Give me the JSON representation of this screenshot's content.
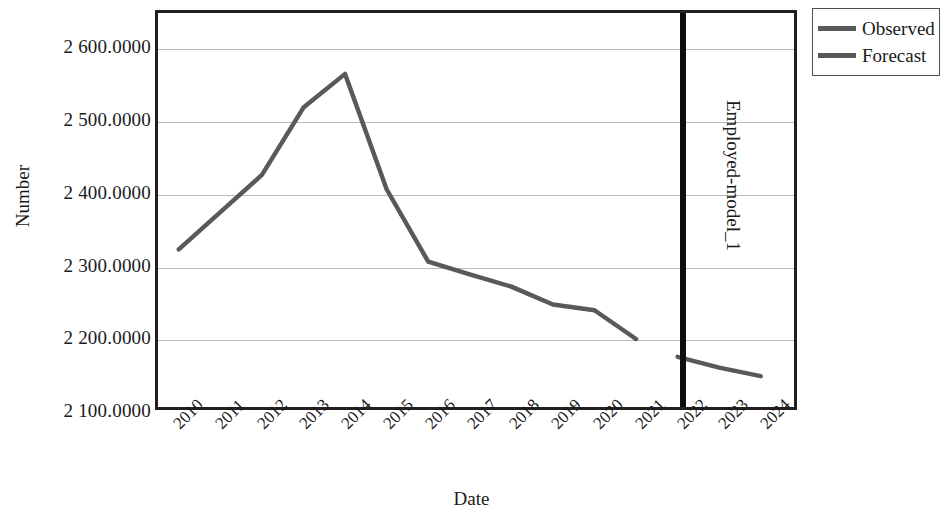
{
  "chart_data": {
    "type": "line",
    "title": "",
    "xlabel": "Date",
    "ylabel": "Number",
    "right_label": "Employed-model_1",
    "x": [
      2010,
      2011,
      2012,
      2013,
      2014,
      2015,
      2016,
      2017,
      2018,
      2019,
      2020,
      2021,
      2022,
      2023,
      2024
    ],
    "categories": [
      "2010",
      "2011",
      "2012",
      "2013",
      "2014",
      "2015",
      "2016",
      "2017",
      "2018",
      "2019",
      "2020",
      "2021",
      "2022",
      "2023",
      "2024"
    ],
    "series": [
      {
        "name": "Observed",
        "color": "#595959",
        "x": [
          2010,
          2011,
          2012,
          2013,
          2014,
          2015,
          2016,
          2017,
          2018,
          2019,
          2020,
          2021
        ],
        "values": [
          2320.0,
          2372.0,
          2424.0,
          2518.0,
          2565.0,
          2404.0,
          2303.0,
          2285.0,
          2268.0,
          2243.0,
          2235.0,
          2195.0
        ]
      },
      {
        "name": "Forecast",
        "color": "#595959",
        "x": [
          2022,
          2023,
          2024
        ],
        "values": [
          2170.0,
          2155.0,
          2143.0
        ]
      }
    ],
    "ylim": [
      2100,
      2650
    ],
    "xlim": [
      2009.5,
      2024.8
    ],
    "yticks": [
      2100,
      2200,
      2300,
      2400,
      2500,
      2600
    ],
    "ytick_labels": [
      "2 100.0000",
      "2 200.0000",
      "2 300.0000",
      "2 400.0000",
      "2 500.0000",
      "2 600.0000"
    ],
    "grid": true,
    "legend_position": "top-right",
    "annotations": [
      {
        "name": "forecast-divider",
        "type": "vline",
        "x": 2022,
        "color": "#0d0d0d"
      }
    ]
  },
  "legend": {
    "items": [
      {
        "label": "Observed",
        "color": "#595959"
      },
      {
        "label": "Forecast",
        "color": "#595959"
      }
    ]
  },
  "axes": {
    "y_title": "Number",
    "x_title": "Date",
    "right_title": "Employed-model_1"
  }
}
